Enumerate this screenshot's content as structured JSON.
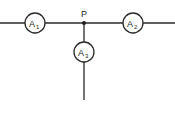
{
  "diagram": {
    "type": "circuit-junction",
    "junction": {
      "label": "P"
    },
    "ammeters": [
      {
        "id": "A1",
        "symbol": "A",
        "subscript": "1",
        "position": "left-branch"
      },
      {
        "id": "A2",
        "symbol": "A",
        "subscript": "2",
        "position": "right-branch"
      },
      {
        "id": "A3",
        "symbol": "A",
        "subscript": "3",
        "position": "lower-branch"
      }
    ],
    "colors": {
      "line": "#2a2a2a",
      "text": "#1e1e1e",
      "background": "#ffffff"
    }
  }
}
